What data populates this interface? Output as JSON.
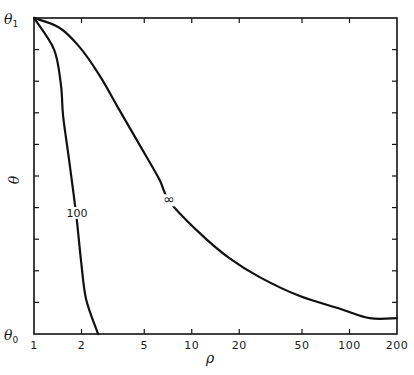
{
  "chart_data": {
    "type": "line",
    "title": "",
    "xlabel": "ρ",
    "ylabel": "θ",
    "xscale": "log",
    "xlim": [
      1,
      200
    ],
    "ylim": [
      0,
      1
    ],
    "x_ticks": [
      1,
      2,
      5,
      10,
      20,
      50,
      100,
      200
    ],
    "x_tick_labels": [
      "1",
      "2",
      "5",
      "10",
      "20",
      "50",
      "100",
      "200"
    ],
    "y_tick_labels": {
      "top": "θ1",
      "bottom": "θ0"
    },
    "y_ticks_minor_count": 9,
    "grid": false,
    "legend": null,
    "series": [
      {
        "name": "100",
        "label_position": {
          "rho": 1.85,
          "theta": 0.38
        },
        "x": [
          1.0,
          1.34,
          1.48,
          1.53,
          1.67,
          1.85,
          1.99,
          2.14,
          2.55
        ],
        "y": [
          1.0,
          0.9,
          0.79,
          0.69,
          0.55,
          0.38,
          0.23,
          0.11,
          0.0
        ]
      },
      {
        "name": "∞",
        "label_position": {
          "rho": 7.2,
          "theta": 0.42
        },
        "x": [
          1.0,
          1.44,
          1.93,
          2.59,
          3.47,
          4.65,
          6.23,
          7.21,
          11.2,
          17.3,
          26.9,
          48.4,
          86.9,
          134.5,
          200
        ],
        "y": [
          1.0,
          0.97,
          0.91,
          0.82,
          0.71,
          0.6,
          0.49,
          0.42,
          0.32,
          0.24,
          0.18,
          0.12,
          0.08,
          0.05,
          0.05
        ]
      }
    ]
  },
  "labels": {
    "x_axis": "ρ",
    "y_axis": "θ",
    "theta_top": "θ",
    "theta_top_sub": "1",
    "theta_bottom": "θ",
    "theta_bottom_sub": "0",
    "curve_100": "100",
    "curve_inf": "∞"
  },
  "style": {
    "line_color": "#111111",
    "background": "#ffffff"
  }
}
